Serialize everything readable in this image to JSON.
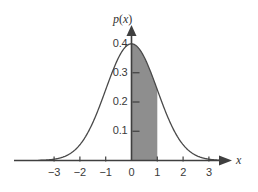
{
  "chart_data": {
    "type": "area",
    "title": "",
    "subtitle": "",
    "xlabel": "x",
    "ylabel": "p(x)",
    "function": "p(x) = (1/sqrt(2*pi)) * exp(-x^2/2)",
    "xlim": [
      -3.6,
      3.6
    ],
    "ylim": [
      0,
      0.44
    ],
    "grid": false,
    "legend": null,
    "x_ticks": [
      {
        "value": -3,
        "label": "−3"
      },
      {
        "value": -2,
        "label": "−2"
      },
      {
        "value": -1,
        "label": "−1"
      },
      {
        "value": 0,
        "label": "0"
      },
      {
        "value": 1,
        "label": "1"
      },
      {
        "value": 2,
        "label": "2"
      },
      {
        "value": 3,
        "label": "3"
      }
    ],
    "y_ticks": [
      {
        "value": 0.1,
        "label": "0.1"
      },
      {
        "value": 0.2,
        "label": "0.2"
      },
      {
        "value": 0.3,
        "label": "0.3"
      },
      {
        "value": 0.4,
        "label": "0.4"
      }
    ],
    "shaded_region": {
      "x_start": 0,
      "x_end": 1,
      "color": "#8e8e8e"
    },
    "peak": {
      "x": 0,
      "y": 0.4
    },
    "curve_color": "#4a4a4a",
    "axis_color": "#3f3f3f",
    "x": [
      -3.6,
      -3.4,
      -3.2,
      -3.0,
      -2.8,
      -2.6,
      -2.4,
      -2.2,
      -2.0,
      -1.8,
      -1.6,
      -1.4,
      -1.2,
      -1.0,
      -0.8,
      -0.6,
      -0.4,
      -0.2,
      0.0,
      0.2,
      0.4,
      0.6,
      0.8,
      1.0,
      1.2,
      1.4,
      1.6,
      1.8,
      2.0,
      2.2,
      2.4,
      2.6,
      2.8,
      3.0,
      3.2,
      3.4,
      3.6
    ],
    "values": [
      0.0006,
      0.0012,
      0.0024,
      0.0044,
      0.0079,
      0.0136,
      0.0224,
      0.0355,
      0.054,
      0.079,
      0.1109,
      0.1497,
      0.1942,
      0.242,
      0.2897,
      0.3332,
      0.3683,
      0.391,
      0.3989,
      0.391,
      0.3683,
      0.3332,
      0.2897,
      0.242,
      0.1942,
      0.1497,
      0.1109,
      0.079,
      0.054,
      0.0355,
      0.0224,
      0.0136,
      0.0079,
      0.0044,
      0.0024,
      0.0012,
      0.0006
    ]
  },
  "axes": {
    "x_axis_name": "x",
    "y_axis_name_p": "p",
    "y_axis_name_paren_open": "(",
    "y_axis_name_var": "x",
    "y_axis_name_paren_close": ")"
  }
}
